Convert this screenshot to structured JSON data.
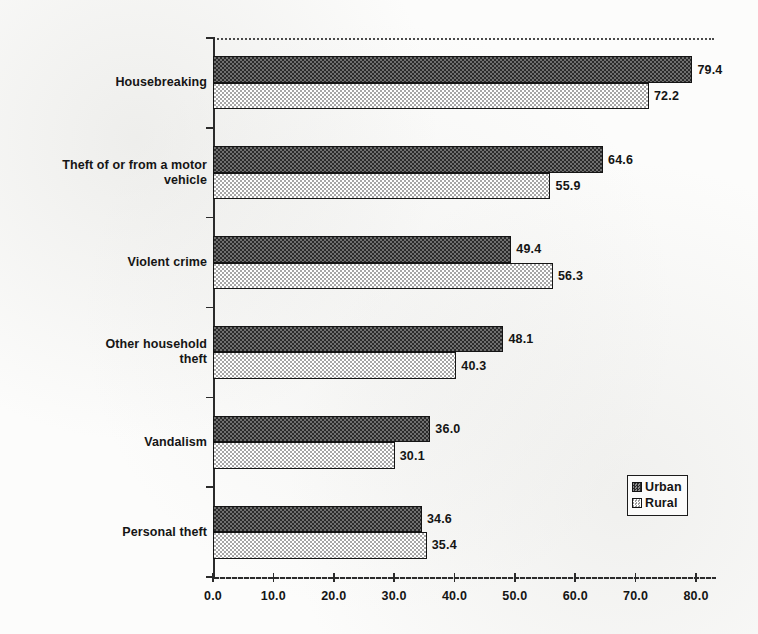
{
  "chart_data": {
    "type": "bar",
    "orientation": "horizontal",
    "title": "",
    "xlabel": "",
    "ylabel": "",
    "xlim": [
      0.0,
      80.0
    ],
    "xticks": [
      "0.0",
      "10.0",
      "20.0",
      "30.0",
      "40.0",
      "50.0",
      "60.0",
      "70.0",
      "80.0"
    ],
    "grid": false,
    "legend_position": "inside-bottom-right",
    "categories": [
      "Housebreaking",
      "Theft of or from a motor vehicle",
      "Violent crime",
      "Other household theft",
      "Vandalism",
      "Personal theft"
    ],
    "series": [
      {
        "name": "Urban",
        "pattern": "dark-checker",
        "values": [
          79.4,
          64.6,
          49.4,
          48.1,
          36.0,
          34.6
        ],
        "labels": [
          "79.4",
          "64.6",
          "49.4",
          "48.1",
          "36.0",
          "34.6"
        ]
      },
      {
        "name": "Rural",
        "pattern": "light-checker",
        "values": [
          72.2,
          55.9,
          56.3,
          40.3,
          30.1,
          35.4
        ],
        "labels": [
          "72.2",
          "55.9",
          "56.3",
          "40.3",
          "30.1",
          "35.4"
        ]
      }
    ]
  },
  "axis": {
    "x": {
      "ticklabels": [
        "0.0",
        "10.0",
        "20.0",
        "30.0",
        "40.0",
        "50.0",
        "60.0",
        "70.0",
        "80.0"
      ]
    },
    "y": {
      "ticklabels": [
        "Housebreaking",
        "Theft of or from a motor vehicle",
        "Violent crime",
        "Other household theft",
        "Vandalism",
        "Personal theft"
      ],
      "label_lines": [
        [
          "Housebreaking"
        ],
        [
          "Theft of or from a motor",
          "vehicle"
        ],
        [
          "Violent crime"
        ],
        [
          "Other household",
          "theft"
        ],
        [
          "Vandalism"
        ],
        [
          "Personal theft"
        ]
      ]
    }
  },
  "legend": {
    "items": [
      {
        "label": "Urban",
        "swatch": "urban-swatch-icon"
      },
      {
        "label": "Rural",
        "swatch": "rural-swatch-icon"
      }
    ]
  },
  "colors": {
    "ink": "#141414",
    "axis": "#2b2b2b",
    "paper": "#fcfcfb",
    "urban_fill": "#3a3a3a",
    "rural_fill": "#c4c4c4"
  }
}
